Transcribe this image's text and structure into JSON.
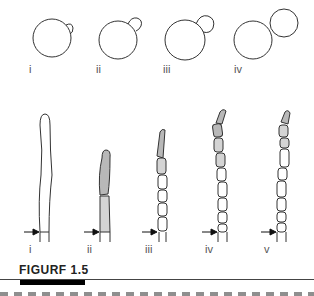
{
  "figure": {
    "caption": "FIGURF 1.5",
    "colors": {
      "stroke": "#333333",
      "shaded_dark": "#b8b8b8",
      "shaded_light": "#d4d4d4",
      "background": "#ffffff"
    }
  },
  "top_row": {
    "description": "Yeast cell budding stages",
    "panels": [
      {
        "label": "i"
      },
      {
        "label": "ii"
      },
      {
        "label": "iii"
      },
      {
        "label": "iv"
      }
    ]
  },
  "bottom_row": {
    "description": "Hyphal tip growth and septation stages",
    "arrow_glyph": "→",
    "panels": [
      {
        "label": "i"
      },
      {
        "label": "ii"
      },
      {
        "label": "iii"
      },
      {
        "label": "iv"
      },
      {
        "label": "v"
      }
    ]
  }
}
